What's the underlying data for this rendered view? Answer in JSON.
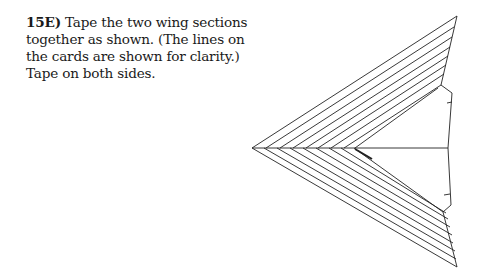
{
  "instruction": {
    "step_number": "15E)",
    "text": " Tape the two wing sections together as shown. (The lines on the cards are shown for clarity.) Tape on both sides."
  },
  "figure": {
    "stroke_color": "#222222"
  }
}
